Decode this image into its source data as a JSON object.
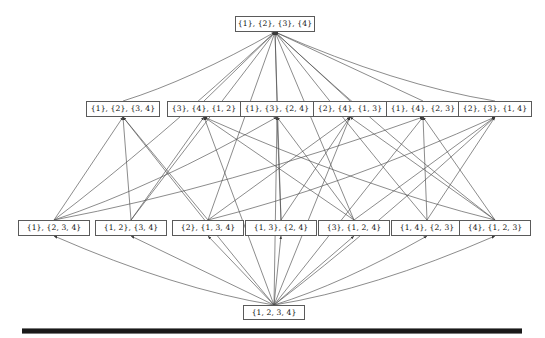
{
  "diagram": {
    "line_color": "#4d4d4d",
    "node_border_color": "#5a5a5a",
    "rule_color": "#1a1a1a",
    "levels": [
      {
        "name": "level-1-singletons",
        "nodes": [
          {
            "id": "n0",
            "label": "{1}, {2}, {3}, {4}",
            "x": 235,
            "y": 16,
            "w": 80,
            "h": 16
          }
        ]
      },
      {
        "name": "level-2-one-pair",
        "nodes": [
          {
            "id": "n1",
            "label": "{1}, {2}, {3, 4}",
            "x": 86,
            "y": 101,
            "w": 74,
            "h": 16
          },
          {
            "id": "n2",
            "label": "{3}, {4}, {1, 2}",
            "x": 167,
            "y": 101,
            "w": 74,
            "h": 16
          },
          {
            "id": "n3",
            "label": "{1}, {3}, {2, 4}",
            "x": 240,
            "y": 101,
            "w": 74,
            "h": 16
          },
          {
            "id": "n4",
            "label": "{2}, {4}, {1, 3}",
            "x": 313,
            "y": 101,
            "w": 74,
            "h": 16
          },
          {
            "id": "n5",
            "label": "{1}, {4}, {2, 3}",
            "x": 386,
            "y": 101,
            "w": 74,
            "h": 16
          },
          {
            "id": "n6",
            "label": "{2}, {3}, {1, 4}",
            "x": 458,
            "y": 101,
            "w": 74,
            "h": 16
          }
        ]
      },
      {
        "name": "level-3-two-blocks",
        "nodes": [
          {
            "id": "n7",
            "label": "{1}, {2, 3, 4}",
            "x": 18,
            "y": 220,
            "w": 72,
            "h": 16
          },
          {
            "id": "n8",
            "label": "{1, 2}, {3, 4}",
            "x": 95,
            "y": 220,
            "w": 72,
            "h": 16
          },
          {
            "id": "n9",
            "label": "{2}, {1, 3, 4}",
            "x": 172,
            "y": 220,
            "w": 72,
            "h": 16
          },
          {
            "id": "n10",
            "label": "{1, 3}, {2, 4}",
            "x": 245,
            "y": 220,
            "w": 72,
            "h": 16
          },
          {
            "id": "n11",
            "label": "{3}, {1, 2, 4}",
            "x": 318,
            "y": 220,
            "w": 72,
            "h": 16
          },
          {
            "id": "n12",
            "label": "{1, 4}, {2, 3}",
            "x": 391,
            "y": 220,
            "w": 72,
            "h": 16
          },
          {
            "id": "n13",
            "label": "{4}, {1, 2, 3}",
            "x": 459,
            "y": 220,
            "w": 72,
            "h": 16
          }
        ]
      },
      {
        "name": "level-4-single-block",
        "nodes": [
          {
            "id": "n14",
            "label": "{1, 2, 3, 4}",
            "x": 243,
            "y": 305,
            "w": 62,
            "h": 15
          }
        ]
      }
    ],
    "bottom_rule": {
      "label": "horizontal-rule",
      "x": 22,
      "y": 328,
      "w": 500,
      "h": 4
    }
  }
}
